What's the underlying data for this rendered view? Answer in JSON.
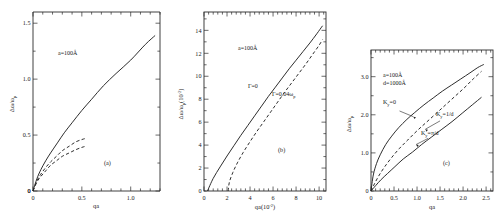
{
  "figure": {
    "caption_tags": [
      "(a)",
      "(b)",
      "(c)"
    ]
  },
  "chart_data": [
    {
      "type": "line",
      "panel": "(a)",
      "title": "",
      "xlabel": "qa",
      "ylabel": "Δω/ωp",
      "xlim": [
        0,
        1.3
      ],
      "ylim": [
        0,
        1.6
      ],
      "xticks": [
        0,
        0.5,
        1.0
      ],
      "xtick_labels": [
        "0",
        "0.5",
        "1.0"
      ],
      "yticks": [
        0,
        0.5,
        1.0,
        1.5
      ],
      "ytick_labels": [
        "0",
        "0.5",
        "1.0",
        "1.5"
      ],
      "grid": false,
      "legend": "none",
      "annotations": [
        {
          "text": "a=100Å",
          "x": 0.3,
          "y": 1.22
        },
        {
          "text": "(a)",
          "x": 0.72,
          "y": 0.22
        }
      ],
      "series": [
        {
          "name": "upper-branch",
          "style": "solid",
          "x": [
            0.0,
            0.04,
            0.08,
            0.13,
            0.18,
            0.25,
            0.32,
            0.4,
            0.5,
            0.6,
            0.72,
            0.85,
            1.0,
            1.15,
            1.25
          ],
          "y": [
            0.0,
            0.11,
            0.19,
            0.27,
            0.34,
            0.43,
            0.52,
            0.61,
            0.72,
            0.82,
            0.94,
            1.05,
            1.17,
            1.31,
            1.39
          ]
        },
        {
          "name": "middle-branch",
          "style": "dashed",
          "x": [
            0.0,
            0.04,
            0.08,
            0.13,
            0.18,
            0.24,
            0.3,
            0.37,
            0.44,
            0.5,
            0.54
          ],
          "y": [
            0.0,
            0.09,
            0.15,
            0.21,
            0.26,
            0.31,
            0.36,
            0.4,
            0.44,
            0.46,
            0.47
          ]
        },
        {
          "name": "lower-branch",
          "style": "dashed",
          "x": [
            0.0,
            0.04,
            0.08,
            0.13,
            0.18,
            0.24,
            0.3,
            0.37,
            0.44,
            0.5,
            0.54
          ],
          "y": [
            0.0,
            0.08,
            0.13,
            0.18,
            0.23,
            0.27,
            0.31,
            0.34,
            0.37,
            0.39,
            0.4
          ]
        }
      ]
    },
    {
      "type": "line",
      "panel": "(b)",
      "title": "",
      "xlabel": "qa(10⁻²)",
      "ylabel": "Δω/ωp (10⁻²)",
      "xlim": [
        0,
        10.6
      ],
      "ylim": [
        0,
        15.6
      ],
      "xticks": [
        0,
        2,
        4,
        6,
        8,
        10
      ],
      "xtick_labels": [
        "0",
        "2",
        "4",
        "6",
        "8",
        "10"
      ],
      "yticks": [
        2,
        4,
        6,
        8,
        10,
        12,
        14
      ],
      "ytick_labels": [
        "2",
        "4",
        "6",
        "8",
        "10",
        "12",
        "14"
      ],
      "grid": false,
      "legend": "inline-labels",
      "annotations": [
        {
          "text": "a=100Å",
          "x": 3.0,
          "y": 12.6
        },
        {
          "text": "Γ=0",
          "x": 4.4,
          "y": 9.3
        },
        {
          "text": "Γ=0.04ωp",
          "x": 6.4,
          "y": 8.4
        },
        {
          "text": "(b)",
          "x": 7.3,
          "y": 3.6
        }
      ],
      "series": [
        {
          "name": "gamma-zero",
          "style": "solid",
          "label": "Γ=0",
          "x": [
            0.3,
            0.8,
            1.4,
            2.0,
            2.6,
            3.2,
            3.8,
            4.4,
            5.0,
            5.6,
            6.2,
            6.8,
            7.4,
            8.0,
            8.6,
            9.2,
            9.8,
            10.3
          ],
          "y": [
            0.0,
            1.1,
            2.1,
            3.05,
            3.95,
            4.85,
            5.7,
            6.55,
            7.4,
            8.25,
            9.05,
            9.85,
            10.65,
            11.4,
            12.15,
            12.9,
            13.7,
            14.4
          ]
        },
        {
          "name": "gamma-damped",
          "style": "dashed",
          "label": "Γ=0.04ωp",
          "x": [
            2.1,
            2.2,
            2.5,
            2.9,
            3.4,
            4.0,
            4.6,
            5.2,
            5.8,
            6.4,
            7.0,
            7.6,
            8.2,
            8.8,
            9.4,
            10.0,
            10.3
          ],
          "y": [
            0.0,
            0.75,
            1.6,
            2.45,
            3.35,
            4.3,
            5.2,
            6.05,
            6.9,
            7.75,
            8.6,
            9.4,
            10.2,
            11.0,
            11.85,
            12.7,
            13.2
          ]
        }
      ]
    },
    {
      "type": "line",
      "panel": "(c)",
      "title": "",
      "xlabel": "qa",
      "ylabel": "Δω/ωp",
      "xlim": [
        0,
        2.65
      ],
      "ylim": [
        0,
        3.7
      ],
      "xticks": [
        0,
        0.5,
        1.0,
        1.5,
        2.0,
        2.5
      ],
      "xtick_labels": [
        "0",
        "0.5",
        "1.0",
        "1.5",
        "2.0",
        "2.5"
      ],
      "yticks": [
        1.0,
        2.0,
        3.0
      ],
      "ytick_labels": [
        "1.0",
        "2.0",
        "3.0"
      ],
      "grid": false,
      "legend": "inline-labels",
      "annotations": [
        {
          "text": "a=100Å",
          "x": 0.32,
          "y": 2.72
        },
        {
          "text": "d=1000Å",
          "x": 0.32,
          "y": 2.52
        },
        {
          "text": "Kᵧ=0",
          "x": 0.4,
          "y": 2.12
        },
        {
          "text": "Kᵧ=1/d",
          "x": 1.55,
          "y": 1.88
        },
        {
          "text": "Kᵧ=π/d",
          "x": 1.3,
          "y": 1.42
        },
        {
          "text": "(c)",
          "x": 1.72,
          "y": 0.72
        }
      ],
      "series": [
        {
          "name": "Ky-zero",
          "style": "solid",
          "label": "Kᵧ=0",
          "x": [
            0.0,
            0.05,
            0.12,
            0.2,
            0.32,
            0.45,
            0.6,
            0.78,
            0.95,
            1.15,
            1.35,
            1.55,
            1.75,
            1.95,
            2.15,
            2.32,
            2.45
          ],
          "y": [
            0.0,
            0.42,
            0.72,
            0.95,
            1.22,
            1.44,
            1.66,
            1.88,
            2.06,
            2.26,
            2.44,
            2.62,
            2.78,
            2.94,
            3.1,
            3.24,
            3.32
          ]
        },
        {
          "name": "Ky-one-over-d",
          "style": "dashed",
          "label": "Kᵧ=1/d",
          "x": [
            0.0,
            0.08,
            0.18,
            0.3,
            0.45,
            0.62,
            0.8,
            1.0,
            1.2,
            1.42,
            1.62,
            1.82,
            2.02,
            2.22,
            2.4
          ],
          "y": [
            0.0,
            0.2,
            0.42,
            0.64,
            0.88,
            1.12,
            1.34,
            1.58,
            1.8,
            2.04,
            2.26,
            2.48,
            2.7,
            2.94,
            3.14
          ]
        },
        {
          "name": "Ky-pi-over-d",
          "style": "solid",
          "label": "Kᵧ=π/d",
          "x": [
            0.0,
            0.1,
            0.22,
            0.36,
            0.52,
            0.7,
            0.9,
            1.1,
            1.32,
            1.54,
            1.76,
            1.98,
            2.2,
            2.4
          ],
          "y": [
            0.0,
            0.14,
            0.3,
            0.46,
            0.64,
            0.84,
            1.02,
            1.22,
            1.42,
            1.62,
            1.82,
            2.04,
            2.26,
            2.46
          ]
        }
      ]
    }
  ]
}
